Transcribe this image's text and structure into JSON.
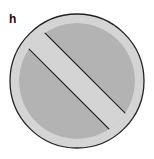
{
  "panel": {
    "label": "h",
    "symbol": "prohibition-sign-icon",
    "colors": {
      "ring": "#d4d4d4",
      "fill": "#b3b3b3",
      "outline": "#222222",
      "background": "#ffffff"
    }
  }
}
